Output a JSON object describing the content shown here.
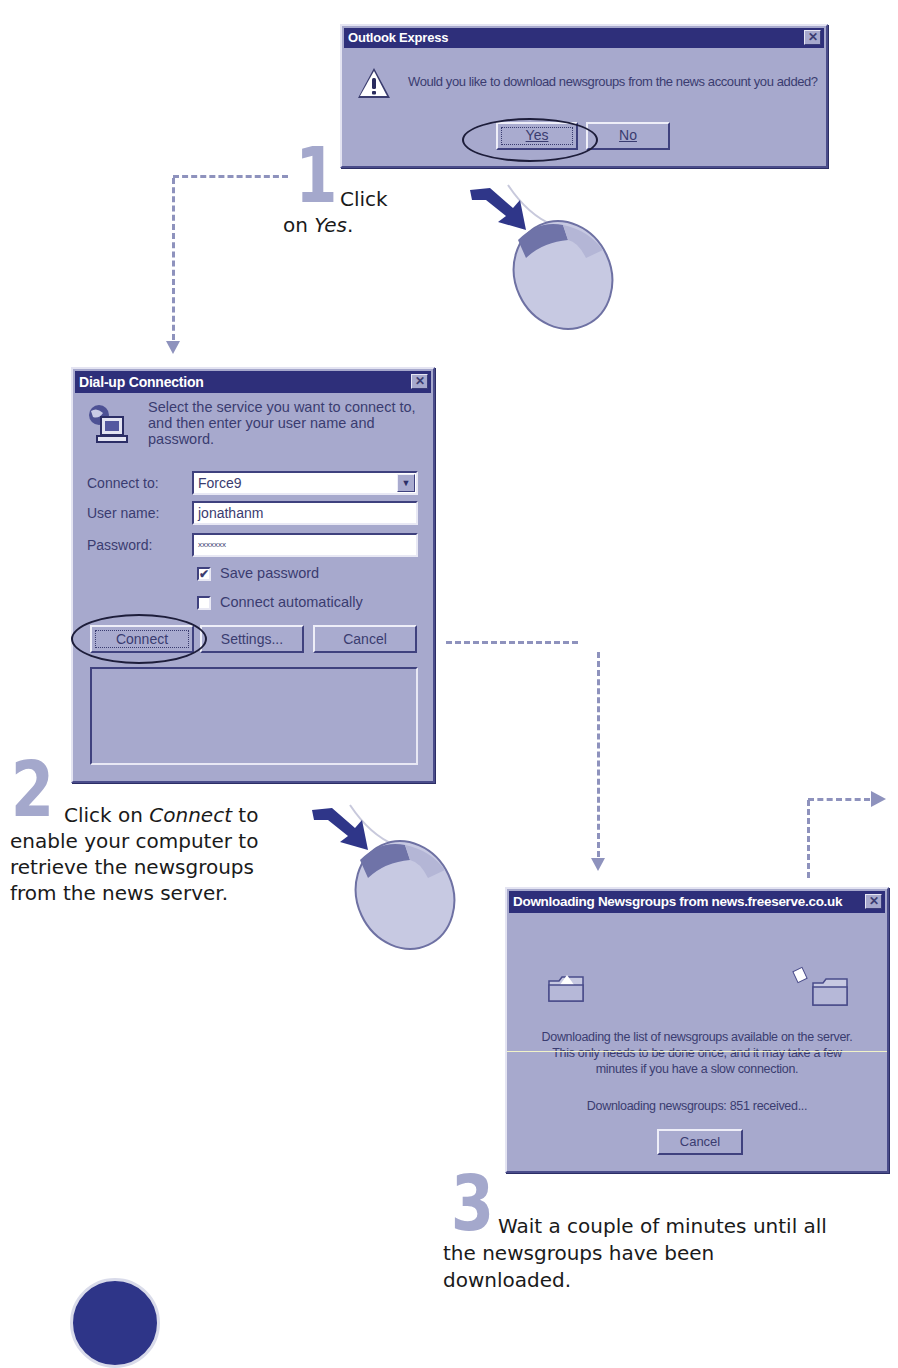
{
  "colors": {
    "dialog_face": "#a7a9cd",
    "titlebar": "#2e2f7a",
    "step_number": "#a4a8cc",
    "connector": "#8e92bd",
    "mouse_arrow": "#2f3689"
  },
  "outlook_dialog": {
    "title": "Outlook Express",
    "icon": "warning-icon",
    "message": "Would you like to download newsgroups from the news account you added?",
    "yes_label": "Yes",
    "no_label": "No",
    "close_glyph": "✕"
  },
  "step1": {
    "number": "1",
    "text_plain": "Click",
    "text_line2_prefix": "on ",
    "text_line2_em": "Yes",
    "text_line2_suffix": "."
  },
  "dialup_dialog": {
    "title": "Dial-up Connection",
    "icon": "network-computer-icon",
    "intro": "Select the service you want to connect to, and then enter your user name and password.",
    "connect_to_label": "Connect to:",
    "connect_to_value": "Force9",
    "username_label": "User name:",
    "username_value": "jonathanm",
    "password_label": "Password:",
    "password_value": "xxxxxxx",
    "save_password_label": "Save password",
    "save_password_checked": true,
    "connect_auto_label": "Connect automatically",
    "connect_auto_checked": false,
    "connect_btn": "Connect",
    "settings_btn": "Settings...",
    "cancel_btn": "Cancel",
    "close_glyph": "✕",
    "dropdown_glyph": "▼",
    "check_glyph": "✔"
  },
  "step2": {
    "number": "2",
    "line1_prefix": "Click on ",
    "line1_em": "Connect",
    "line1_suffix": " to",
    "line2": "enable your computer to",
    "line3": "retrieve the newsgroups",
    "line4": "from the news server."
  },
  "download_dialog": {
    "title": "Downloading Newsgroups from news.freeserve.co.uk",
    "message_line1": "Downloading the list of newsgroups available on the server.",
    "message_line2": "This only needs to be done once, and it may take a few",
    "message_line3": "minutes if you have a slow connection.",
    "status": "Downloading newsgroups: 851 received...",
    "cancel_btn": "Cancel",
    "close_glyph": "✕"
  },
  "step3": {
    "number": "3",
    "line1": "Wait a couple of minutes until all",
    "line2": "the newsgroups have been",
    "line3": "downloaded."
  }
}
